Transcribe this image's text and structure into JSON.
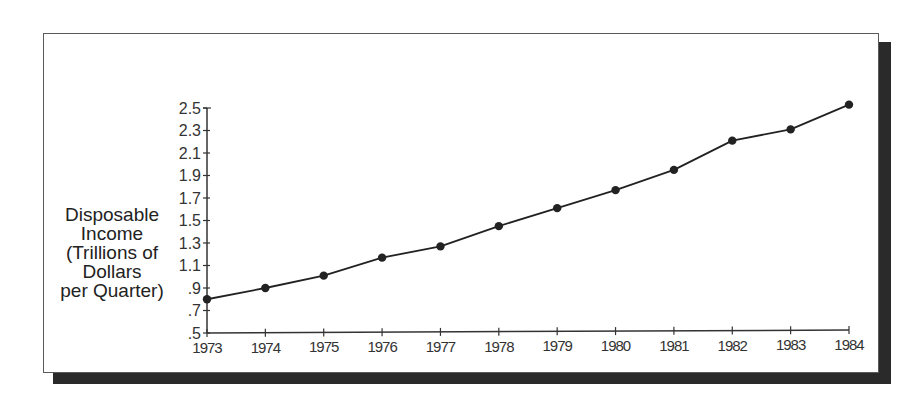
{
  "chart_data": {
    "type": "line",
    "title": "",
    "xlabel": "",
    "ylabel": "Disposable Income (Trillions of Dollars per Quarter)",
    "ylabel_lines": [
      "Disposable",
      "Income",
      "(Trillions of",
      "Dollars",
      "per Quarter)"
    ],
    "categories": [
      "1973",
      "1974",
      "1975",
      "1976",
      "1977",
      "1978",
      "1979",
      "1980",
      "1981",
      "1982",
      "1983",
      "1984"
    ],
    "series": [
      {
        "name": "Disposable Income",
        "values": [
          0.8,
          0.9,
          1.01,
          1.17,
          1.27,
          1.45,
          1.61,
          1.77,
          1.95,
          2.21,
          2.31,
          2.53
        ],
        "marker": "filled-circle",
        "color": "#222222"
      }
    ],
    "yticks": [
      ".5",
      ".7",
      ".9",
      "1.1",
      "1.3",
      "1.5",
      "1.7",
      "1.9",
      "2.1",
      "2.3",
      "2.5"
    ],
    "ytick_values": [
      0.5,
      0.7,
      0.9,
      1.1,
      1.3,
      1.5,
      1.7,
      1.9,
      2.1,
      2.3,
      2.5
    ],
    "ylim": [
      0.5,
      2.5
    ],
    "grid": false,
    "legend": "none",
    "frame": "box with drop shadow"
  }
}
